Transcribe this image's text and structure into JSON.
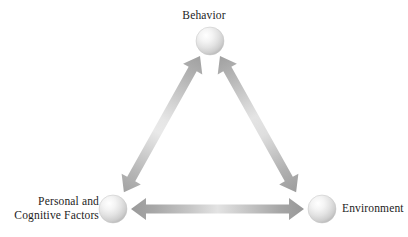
{
  "diagram": {
    "type": "triangle-reciprocal",
    "background_color": "#ffffff",
    "nodes": [
      {
        "id": "behavior",
        "label": "Behavior",
        "shape": "sphere",
        "position": "top",
        "center": [
          210,
          41
        ],
        "radius": 14,
        "fill_highlight": "#ffffff",
        "fill_shadow": "#bcbcbc"
      },
      {
        "id": "personal",
        "label_line1": "Personal and",
        "label_line2": "Cognitive Factors",
        "shape": "sphere",
        "position": "bottom-left",
        "center": [
          113,
          209
        ],
        "radius": 14,
        "fill_highlight": "#ffffff",
        "fill_shadow": "#bcbcbc"
      },
      {
        "id": "environment",
        "label": "Environment",
        "shape": "sphere",
        "position": "bottom-right",
        "center": [
          322,
          209
        ],
        "radius": 14,
        "fill_highlight": "#ffffff",
        "fill_shadow": "#bcbcbc"
      }
    ],
    "connectors": [
      {
        "id": "behavior-personal",
        "from": "behavior",
        "to": "personal",
        "style": "double-headed-arrow",
        "color_dark": "#9a9a9a",
        "color_light": "#e0e0e0"
      },
      {
        "id": "behavior-environment",
        "from": "behavior",
        "to": "environment",
        "style": "double-headed-arrow",
        "color_dark": "#9a9a9a",
        "color_light": "#e0e0e0"
      },
      {
        "id": "personal-environment",
        "from": "personal",
        "to": "environment",
        "style": "double-headed-arrow",
        "color_dark": "#9a9a9a",
        "color_light": "#e0e0e0"
      }
    ]
  }
}
